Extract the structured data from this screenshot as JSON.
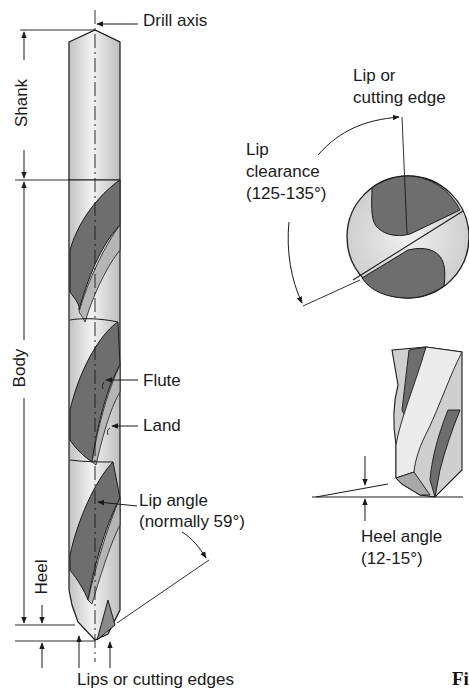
{
  "diagram": {
    "main_view": {
      "labels": {
        "drill_axis": "Drill axis",
        "shank": "Shank",
        "body": "Body",
        "heel": "Heel",
        "flute": "Flute",
        "land": "Land",
        "lip_angle_line1": "Lip angle",
        "lip_angle_line2": "(normally 59°)",
        "lips": "Lips or cutting edges"
      }
    },
    "end_view": {
      "labels": {
        "lip_edge_line1": "Lip or",
        "lip_edge_line2": "cutting edge",
        "lip_clearance_line1": "Lip",
        "lip_clearance_line2": "clearance",
        "lip_clearance_line3": "(125-135°)"
      }
    },
    "heel_view": {
      "labels": {
        "heel_angle_line1": "Heel angle",
        "heel_angle_line2": "(12-15°)"
      }
    },
    "figure_caption_fragment": "Fi",
    "colors": {
      "line": "#1a1a1a",
      "steel_light": "#e4e4e4",
      "steel_mid": "#bdbdbd",
      "flute_dark": "#6e6e6e"
    }
  }
}
